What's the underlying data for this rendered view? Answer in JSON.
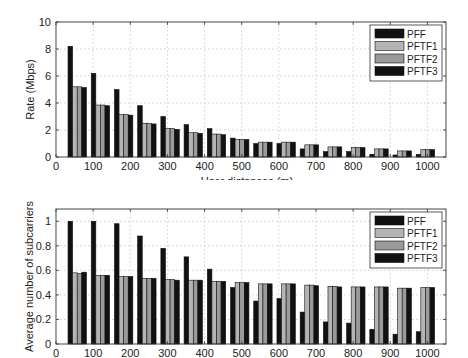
{
  "chart_data": [
    {
      "type": "bar",
      "title": "",
      "xlabel": "User distances (m)",
      "ylabel": "Rate (Mbps)",
      "xlim": [
        0,
        1050
      ],
      "ylim": [
        0,
        10
      ],
      "xticks": [
        0,
        100,
        200,
        300,
        400,
        500,
        600,
        700,
        800,
        900,
        1000
      ],
      "yticks": [
        0,
        2,
        4,
        6,
        8,
        10
      ],
      "grid": true,
      "legend_position": "upper right",
      "categories": [
        62.5,
        125,
        187.5,
        250,
        312.5,
        375,
        437.5,
        500,
        562.5,
        625,
        687.5,
        750,
        812.5,
        875,
        937.5,
        1000
      ],
      "series": [
        {
          "name": "PFF",
          "color": "#111111",
          "values": [
            8.2,
            6.2,
            5.0,
            3.8,
            3.0,
            2.4,
            2.1,
            1.4,
            1.0,
            1.0,
            0.6,
            0.4,
            0.4,
            0.2,
            0.15,
            0.2
          ]
        },
        {
          "name": "PFTF1",
          "color": "#b4b4b4",
          "values": [
            5.2,
            3.85,
            3.15,
            2.5,
            2.1,
            1.8,
            1.7,
            1.3,
            1.1,
            1.1,
            0.9,
            0.75,
            0.7,
            0.6,
            0.45,
            0.55
          ]
        },
        {
          "name": "PFTF2",
          "color": "#9a9a9a",
          "values": [
            5.2,
            3.85,
            3.15,
            2.5,
            2.1,
            1.8,
            1.7,
            1.3,
            1.1,
            1.1,
            0.9,
            0.75,
            0.7,
            0.6,
            0.45,
            0.55
          ]
        },
        {
          "name": "PFTF3",
          "color": "#111111",
          "values": [
            5.15,
            3.8,
            3.1,
            2.45,
            2.05,
            1.75,
            1.65,
            1.3,
            1.1,
            1.1,
            0.9,
            0.75,
            0.7,
            0.6,
            0.45,
            0.55
          ]
        }
      ]
    },
    {
      "type": "bar",
      "title": "",
      "xlabel": "",
      "ylabel": "Average number of subcarriers",
      "xlim": [
        0,
        1050
      ],
      "ylim": [
        0,
        1.1
      ],
      "xticks": [
        0,
        100,
        200,
        300,
        400,
        500,
        600,
        700,
        800,
        900,
        1000
      ],
      "yticks": [
        0,
        0.2,
        0.4,
        0.6,
        0.8,
        1
      ],
      "grid": true,
      "legend_position": "upper right",
      "categories": [
        62.5,
        125,
        187.5,
        250,
        312.5,
        375,
        437.5,
        500,
        562.5,
        625,
        687.5,
        750,
        812.5,
        875,
        937.5,
        1000
      ],
      "series": [
        {
          "name": "PFF",
          "color": "#111111",
          "values": [
            1.0,
            1.0,
            0.98,
            0.88,
            0.78,
            0.71,
            0.61,
            0.46,
            0.35,
            0.37,
            0.26,
            0.18,
            0.17,
            0.12,
            0.08,
            0.1
          ]
        },
        {
          "name": "PFTF1",
          "color": "#b4b4b4",
          "values": [
            0.58,
            0.56,
            0.55,
            0.535,
            0.525,
            0.52,
            0.51,
            0.5,
            0.49,
            0.49,
            0.48,
            0.47,
            0.465,
            0.465,
            0.455,
            0.46
          ]
        },
        {
          "name": "PFTF2",
          "color": "#9a9a9a",
          "values": [
            0.575,
            0.56,
            0.55,
            0.535,
            0.525,
            0.52,
            0.51,
            0.5,
            0.49,
            0.49,
            0.48,
            0.47,
            0.465,
            0.465,
            0.455,
            0.46
          ]
        },
        {
          "name": "PFTF3",
          "color": "#111111",
          "values": [
            0.585,
            0.56,
            0.55,
            0.535,
            0.52,
            0.52,
            0.51,
            0.5,
            0.49,
            0.49,
            0.475,
            0.465,
            0.465,
            0.465,
            0.455,
            0.46
          ]
        }
      ]
    }
  ],
  "charts": {
    "top": {
      "ylabel": "Rate (Mbps)",
      "xlabel": "User distances (m)"
    },
    "bottom": {
      "ylabel": "Average number of subcarriers"
    }
  }
}
